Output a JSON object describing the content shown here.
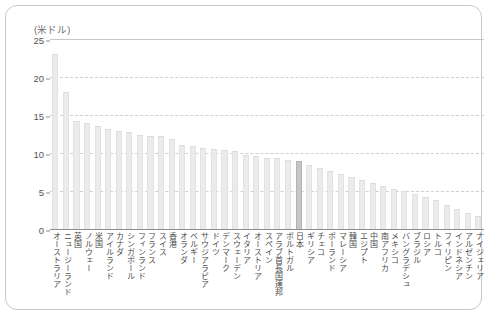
{
  "chart": {
    "unit_label": "(米ドル)",
    "y_ticks": [
      "25",
      "20",
      "15",
      "10",
      "5",
      "0"
    ]
  },
  "chart_data": {
    "type": "bar",
    "title": "",
    "xlabel": "",
    "ylabel": "(米ドル)",
    "ylim": [
      0,
      25
    ],
    "yticks": [
      0,
      5,
      10,
      15,
      20,
      25
    ],
    "grid": true,
    "legend": false,
    "highlight_category": "日本",
    "categories": [
      "オーストラリア",
      "ニュージーランド",
      "英国",
      "ノルウェー",
      "米国",
      "アイルランド",
      "カナダ",
      "シンガポール",
      "フィンランド",
      "フランス",
      "スイス",
      "香港",
      "オランダ",
      "ベルギー",
      "サウジアラビア",
      "ドイツ",
      "デンマーク",
      "スウェーデン",
      "イタリア",
      "オーストリア",
      "スペイン",
      "アラブ首長国連邦",
      "ポルトガル",
      "日本",
      "ギリシア",
      "チェコ",
      "ポーランド",
      "マレーシア",
      "韓国",
      "エジプト",
      "中国",
      "南アフリカ",
      "メキシコ",
      "バングラデシュ",
      "ブラジル",
      "ロシア",
      "トルコ",
      "フィリピン",
      "インドネシア",
      "アルゼンチン",
      "ナイジェリア"
    ],
    "values": [
      23.0,
      18.0,
      14.2,
      13.9,
      13.5,
      13.1,
      12.9,
      12.8,
      12.4,
      12.3,
      12.2,
      11.9,
      11.0,
      10.9,
      10.7,
      10.5,
      10.4,
      10.2,
      9.8,
      9.6,
      9.4,
      9.3,
      9.1,
      9.0,
      8.4,
      8.0,
      7.6,
      7.2,
      6.9,
      6.5,
      6.0,
      5.6,
      5.3,
      5.0,
      4.6,
      4.2,
      3.8,
      3.2,
      2.6,
      2.1,
      1.7
    ]
  }
}
